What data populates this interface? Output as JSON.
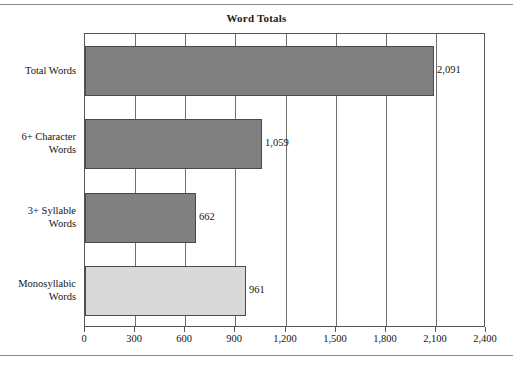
{
  "chart_data": {
    "type": "bar",
    "orientation": "horizontal",
    "title": "Word Totals",
    "xlabel": "",
    "ylabel": "",
    "categories": [
      "Total Words",
      "6+ Character Words",
      "3+ Syllable Words",
      "Monosyllabic Words"
    ],
    "category_lines": [
      [
        "Total Words"
      ],
      [
        "6+ Character",
        "Words"
      ],
      [
        "3+ Syllable",
        "Words"
      ],
      [
        "Monosyllabic",
        "Words"
      ]
    ],
    "values": [
      2091,
      1059,
      662,
      961
    ],
    "value_labels": [
      "2,091",
      "1,059",
      "662",
      "961"
    ],
    "bar_colors": [
      "#808080",
      "#808080",
      "#808080",
      "#d9d9d9"
    ],
    "xlim": [
      0,
      2400
    ],
    "xticks": [
      0,
      300,
      600,
      900,
      1200,
      1500,
      1800,
      2100,
      2400
    ],
    "xtick_labels": [
      "0",
      "300",
      "600",
      "900",
      "1,200",
      "1,500",
      "1,800",
      "2,100",
      "2,400"
    ],
    "grid": true,
    "grid_axis": "x",
    "legend": false,
    "plot_border_color": "#555555",
    "gridline_color": "#6f6f6f",
    "bar_border_color": "#4a4a4a"
  }
}
